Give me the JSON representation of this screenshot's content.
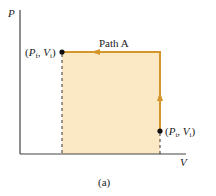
{
  "figure": {
    "caption": "(a)",
    "axes": {
      "x_label": "V",
      "y_label": "P"
    },
    "path_label": "Path A",
    "points": {
      "final": {
        "P": "P",
        "P_sub": "f",
        "V": "V",
        "V_sub": "i"
      },
      "initial": {
        "P": "P",
        "P_sub": "i",
        "V": "V",
        "V_sub": "i"
      }
    },
    "colors": {
      "path": "#d4952a",
      "fill": "#fbe9c6",
      "axis": "#333333"
    }
  }
}
